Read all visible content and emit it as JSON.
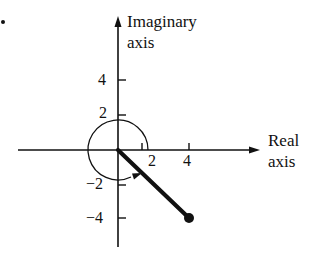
{
  "diagram": {
    "type": "complex-plane",
    "axes": {
      "real_label_line1": "Real",
      "real_label_line2": "axis",
      "imag_label_line1": "Imaginary",
      "imag_label_line2": "axis"
    },
    "ticks": {
      "x": [
        {
          "value": 2,
          "label": "2"
        },
        {
          "value": 4,
          "label": "4"
        }
      ],
      "y": [
        {
          "value": 4,
          "label": "4"
        },
        {
          "value": 2,
          "label": "2"
        },
        {
          "value": -2,
          "label": "−2"
        },
        {
          "value": -4,
          "label": "−4"
        }
      ]
    },
    "vector": {
      "from": [
        0,
        0
      ],
      "to": [
        4,
        -4
      ],
      "endpoint": "filled-dot"
    },
    "angle_arc": {
      "center": [
        0,
        0
      ],
      "direction": "counterclockwise",
      "note": "near-full circle arc with arrowhead indicating angle"
    },
    "marker": "•"
  }
}
